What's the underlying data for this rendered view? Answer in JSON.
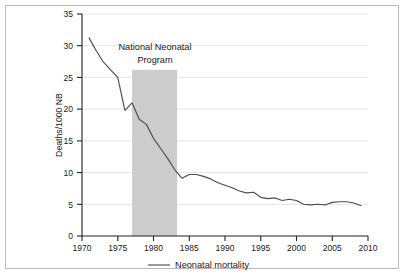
{
  "chart_data": {
    "type": "line",
    "title": "",
    "subtitle": "",
    "xlabel": "",
    "ylabel": "Deaths/1000 NB",
    "xlim": [
      1970,
      2010
    ],
    "ylim": [
      0,
      35
    ],
    "grid": "horizontal",
    "legend_position": "bottom-center",
    "x_ticks": [
      "1970",
      "1975",
      "1980",
      "1985",
      "1990",
      "1995",
      "2000",
      "2005",
      "2010"
    ],
    "y_ticks": [
      "0",
      "5",
      "10",
      "15",
      "20",
      "25",
      "30",
      "35"
    ],
    "series": [
      {
        "name": "Neonatal mortality",
        "color": "#4d4d4d",
        "x": [
          1971,
          1972,
          1973,
          1974,
          1975,
          1976,
          1977,
          1978,
          1979,
          1980,
          1981,
          1982,
          1983,
          1984,
          1985,
          1986,
          1987,
          1988,
          1989,
          1990,
          1991,
          1992,
          1993,
          1994,
          1995,
          1996,
          1997,
          1998,
          1999,
          2000,
          2001,
          2002,
          2003,
          2004,
          2005,
          2006,
          2007,
          2008,
          2009
        ],
        "values": [
          31.2,
          29.2,
          27.4,
          26.2,
          25.0,
          19.8,
          21.0,
          18.4,
          17.6,
          15.4,
          13.8,
          12.2,
          10.4,
          9.1,
          9.7,
          9.7,
          9.4,
          9.0,
          8.4,
          8.0,
          7.6,
          7.1,
          6.8,
          6.9,
          6.1,
          5.9,
          6.0,
          5.6,
          5.8,
          5.6,
          5.0,
          4.9,
          5.0,
          4.9,
          5.3,
          5.4,
          5.4,
          5.2,
          4.8
        ]
      }
    ],
    "annotations": [
      {
        "name": "national-neonatal-program",
        "line1": "National Neonatal",
        "line2": "Program",
        "band_start": 1978,
        "band_end": 1984.3,
        "band_top_value": 26.2,
        "band_color": "#cccccc"
      }
    ],
    "legend": [
      {
        "label": "Neonatal mortality",
        "color": "#4d4d4d"
      }
    ]
  }
}
